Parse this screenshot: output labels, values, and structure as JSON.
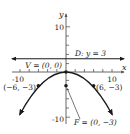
{
  "diagram": {
    "type": "parabola-graph",
    "equation_implied": "x^2 = -12y",
    "axes": {
      "x_label": "x",
      "y_label": "y",
      "x_ticks_labeled": [
        {
          "value": -10,
          "label": "-10"
        },
        {
          "value": 10,
          "label": "10"
        }
      ],
      "y_ticks_labeled": [
        {
          "value": 10,
          "label": "10"
        },
        {
          "value": -10,
          "label": "-10"
        }
      ],
      "tick_step": 2
    },
    "directrix": {
      "label": "D: y = 3",
      "y": 3
    },
    "vertex": {
      "label": "V = (0, 0)",
      "x": 0,
      "y": 0
    },
    "focus": {
      "label": "F = (0, −3)",
      "x": 0,
      "y": -3
    },
    "points": [
      {
        "label": "(−6, −3)",
        "x": -6,
        "y": -3
      },
      {
        "label": "(6, −3)",
        "x": 6,
        "y": -3
      }
    ],
    "colors": {
      "ink": "#1a1a1a",
      "axis": "#555555"
    }
  }
}
